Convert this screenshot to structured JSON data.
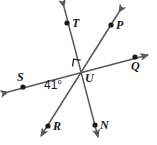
{
  "figure": {
    "type": "geometry-diagram",
    "width": 157,
    "height": 145,
    "background_color": "#ffffff",
    "stroke_color": "#58595b",
    "label_color": "#1a1a1a",
    "vertex": "U",
    "points": [
      {
        "id": "T",
        "label": "T",
        "dot_x": 67,
        "dot_y": 23,
        "label_x": 72,
        "label_y": 17
      },
      {
        "id": "P",
        "label": "P",
        "dot_x": 111,
        "dot_y": 25,
        "label_x": 116,
        "label_y": 19
      },
      {
        "id": "S",
        "label": "S",
        "dot_x": 23,
        "dot_y": 87,
        "label_x": 17,
        "label_y": 71
      },
      {
        "id": "Q",
        "label": "Q",
        "dot_x": 135,
        "dot_y": 57,
        "label_x": 131,
        "label_y": 60
      },
      {
        "id": "U",
        "label": "U",
        "dot_x": 82,
        "dot_y": 72,
        "label_x": 85,
        "label_y": 72
      },
      {
        "id": "R",
        "label": "R",
        "dot_x": 48,
        "dot_y": 126,
        "label_x": 53,
        "label_y": 120
      },
      {
        "id": "N",
        "label": "N",
        "dot_x": 95,
        "dot_y": 125,
        "label_x": 100,
        "label_y": 119
      }
    ],
    "lines": [
      {
        "id": "line-SQ",
        "from": "S",
        "to": "Q",
        "x1": 4,
        "y1": 93,
        "x2": 152,
        "y2": 54
      },
      {
        "id": "line-TN",
        "from": "T",
        "to": "N",
        "x1": 63,
        "y1": 3,
        "x2": 99,
        "y2": 141
      },
      {
        "id": "line-PR",
        "from": "P",
        "to": "R",
        "x1": 122,
        "y1": 8,
        "x2": 38,
        "y2": 140
      }
    ],
    "angles": [
      {
        "id": "angle-SUR",
        "label": "41°",
        "value": 41,
        "unit": "degrees",
        "label_x": 44,
        "label_y": 79
      },
      {
        "id": "angle-TUS",
        "label": "right angle",
        "value": 90,
        "unit": "degrees",
        "marker": "square",
        "marker_x": 73,
        "marker_y": 60
      }
    ]
  }
}
